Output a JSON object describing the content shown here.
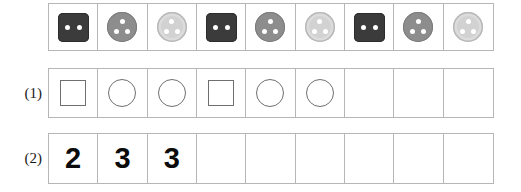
{
  "worksheet": {
    "rows": [
      {
        "id": "buttons",
        "label": "",
        "cells": [
          {
            "kind": "square-dark",
            "holes": 2,
            "color": "#3b3b3b"
          },
          {
            "kind": "circle-medium",
            "holes": 3,
            "color": "#8d8d8d"
          },
          {
            "kind": "circle-light",
            "holes": 3,
            "color": "#d2d2d2"
          },
          {
            "kind": "square-dark",
            "holes": 2,
            "color": "#3b3b3b"
          },
          {
            "kind": "circle-medium",
            "holes": 3,
            "color": "#8d8d8d"
          },
          {
            "kind": "circle-light",
            "holes": 3,
            "color": "#d2d2d2"
          },
          {
            "kind": "square-dark",
            "holes": 2,
            "color": "#3b3b3b"
          },
          {
            "kind": "circle-medium",
            "holes": 3,
            "color": "#8d8d8d"
          },
          {
            "kind": "circle-light",
            "holes": 3,
            "color": "#d2d2d2"
          }
        ]
      },
      {
        "id": "shapes",
        "label": "(1)",
        "cells": [
          {
            "kind": "square"
          },
          {
            "kind": "circle"
          },
          {
            "kind": "circle"
          },
          {
            "kind": "square"
          },
          {
            "kind": "circle"
          },
          {
            "kind": "circle"
          },
          {
            "kind": "empty"
          },
          {
            "kind": "empty"
          },
          {
            "kind": "empty"
          }
        ]
      },
      {
        "id": "numbers",
        "label": "(2)",
        "cells": [
          {
            "kind": "digit",
            "value": "2"
          },
          {
            "kind": "digit",
            "value": "3"
          },
          {
            "kind": "digit",
            "value": "3"
          },
          {
            "kind": "empty",
            "value": ""
          },
          {
            "kind": "empty",
            "value": ""
          },
          {
            "kind": "empty",
            "value": ""
          },
          {
            "kind": "empty",
            "value": ""
          },
          {
            "kind": "empty",
            "value": ""
          },
          {
            "kind": "empty",
            "value": ""
          }
        ]
      }
    ]
  },
  "colors": {
    "grid_border": "#b6b6b6",
    "outline": "#6f6f6f",
    "digit": "#0b0b0b",
    "hole": "#ffffff",
    "page_background": "#ffffff"
  }
}
